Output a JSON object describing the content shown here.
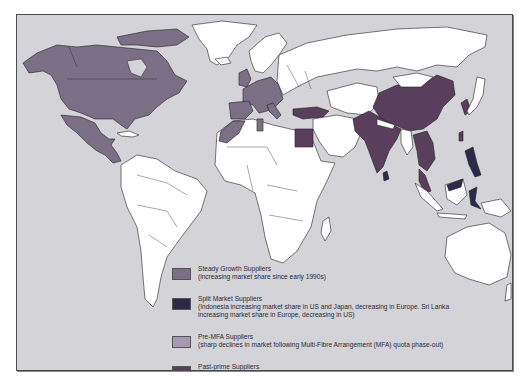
{
  "map": {
    "title": "",
    "colors": {
      "ocean": "#d3d3d8",
      "neutral": "#ffffff",
      "steady_growth": "#7b6f86",
      "split_market": "#2b2a48",
      "pre_mfa": "#a59ab0",
      "past_prime": "#5a3f5c"
    },
    "regions": [
      {
        "name": "North America (USA, Canada)",
        "category": "steady_growth"
      },
      {
        "name": "Mexico & Central America",
        "category": "steady_growth"
      },
      {
        "name": "Western Europe",
        "category": "steady_growth"
      },
      {
        "name": "Morocco / Tunisia",
        "category": "steady_growth"
      },
      {
        "name": "Turkey",
        "category": "past_prime"
      },
      {
        "name": "Egypt",
        "category": "past_prime"
      },
      {
        "name": "China",
        "category": "past_prime"
      },
      {
        "name": "India / Pakistan / Bangladesh",
        "category": "past_prime"
      },
      {
        "name": "Southeast Asia mainland",
        "category": "past_prime"
      },
      {
        "name": "Philippines",
        "category": "split_market"
      },
      {
        "name": "Indonesia",
        "category": "split_market"
      },
      {
        "name": "Sri Lanka",
        "category": "split_market"
      },
      {
        "name": "South Korea / Taiwan / Hong Kong",
        "category": "pre_mfa"
      },
      {
        "name": "Japan",
        "category": "pre_mfa"
      }
    ]
  },
  "legend": {
    "items": [
      {
        "key": "steady_growth",
        "title": "Steady Growth Suppliers",
        "description": "(increasing market share since early 1990s)",
        "description2": ""
      },
      {
        "key": "split_market",
        "title": "Split Market Suppliers",
        "description": "(Indonesia increasing market share in US and Japan, decreasing in Europe. Sri Lanka",
        "description2": "increasing market share in Europe, decreasing in US)"
      },
      {
        "key": "pre_mfa",
        "title": "Pre-MFA Suppliers",
        "description": "(sharp declines in market following Multi-Fibre Arrangement (MFA) quota phase-out)",
        "description2": ""
      },
      {
        "key": "past_prime",
        "title": "Past-prime Suppliers",
        "description": "(decreasing market share since early 1990s)",
        "description2": ""
      }
    ]
  }
}
